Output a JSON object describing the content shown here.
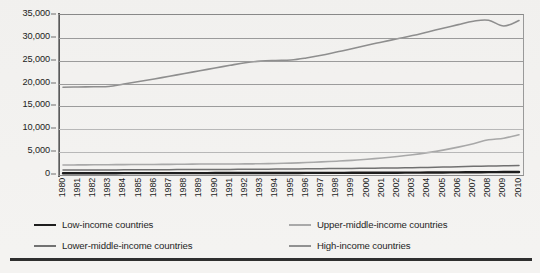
{
  "chart_data": {
    "type": "line",
    "title": "",
    "xlabel": "",
    "ylabel": "",
    "ylim": [
      0,
      35000
    ],
    "yticks": [
      0,
      5000,
      10000,
      15000,
      20000,
      25000,
      30000,
      35000
    ],
    "ytick_labels": [
      "0",
      "5,000",
      "10,000",
      "15,000",
      "20,000",
      "25,000",
      "30,000",
      "35,000"
    ],
    "grid": true,
    "legend_position": "bottom",
    "x": [
      1980,
      1981,
      1982,
      1983,
      1984,
      1985,
      1986,
      1987,
      1988,
      1989,
      1990,
      1991,
      1992,
      1993,
      1994,
      1995,
      1996,
      1997,
      1998,
      1999,
      2000,
      2001,
      2002,
      2003,
      2004,
      2005,
      2006,
      2007,
      2008,
      2009,
      2010
    ],
    "xtick_labels": [
      "1980",
      "1981",
      "1982",
      "1983",
      "1984",
      "1985",
      "1986",
      "1987",
      "1988",
      "1989",
      "1990",
      "1991",
      "1992",
      "1993",
      "1994",
      "1995",
      "1996",
      "1997",
      "1998",
      "1999",
      "2000",
      "2001",
      "2002",
      "2003",
      "2004",
      "2005",
      "2006",
      "2007",
      "2008",
      "2009",
      "2010"
    ],
    "series": [
      {
        "name": "Low-income countries",
        "color": "#1a1a1a",
        "width": 2.4,
        "values": [
          380,
          385,
          390,
          395,
          400,
          405,
          410,
          415,
          418,
          420,
          422,
          424,
          428,
          432,
          438,
          445,
          455,
          465,
          472,
          480,
          490,
          498,
          508,
          520,
          538,
          558,
          580,
          605,
          628,
          640,
          660
        ]
      },
      {
        "name": "Lower-middle-income countries",
        "color": "#6f6f6f",
        "width": 1.5,
        "values": [
          1080,
          1095,
          1105,
          1115,
          1125,
          1140,
          1155,
          1170,
          1185,
          1200,
          1215,
          1230,
          1250,
          1270,
          1295,
          1320,
          1350,
          1385,
          1405,
          1430,
          1470,
          1505,
          1550,
          1600,
          1665,
          1730,
          1805,
          1890,
          1960,
          2000,
          2100
        ]
      },
      {
        "name": "Upper-middle-income countries",
        "color": "#a8a8a8",
        "width": 1.6,
        "values": [
          2180,
          2210,
          2230,
          2250,
          2270,
          2290,
          2310,
          2330,
          2360,
          2390,
          2400,
          2410,
          2430,
          2460,
          2520,
          2600,
          2720,
          2870,
          3020,
          3200,
          3450,
          3720,
          4040,
          4420,
          4900,
          5450,
          6100,
          6850,
          7700,
          8050,
          8800
        ]
      },
      {
        "name": "High-income countries",
        "color": "#8f8f8f",
        "width": 1.6,
        "values": [
          19200,
          19250,
          19300,
          19350,
          19900,
          20450,
          21000,
          21600,
          22200,
          22800,
          23400,
          24000,
          24550,
          24900,
          25050,
          25150,
          25600,
          26200,
          26900,
          27600,
          28400,
          29100,
          29800,
          30500,
          31300,
          32100,
          32900,
          33650,
          33850,
          32600,
          33800
        ]
      }
    ]
  },
  "legend": {
    "items": [
      {
        "label": "Low-income countries"
      },
      {
        "label": "Upper-middle-income countries"
      },
      {
        "label": "Lower-middle-income countries"
      },
      {
        "label": "High-income countries"
      }
    ]
  }
}
